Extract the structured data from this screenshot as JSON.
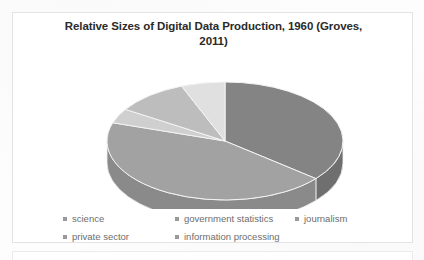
{
  "document": {
    "background_color": "#fdfdfd",
    "frame_border_color": "#e3e3e3"
  },
  "chart": {
    "title_line_1": "Relative Sizes of Digital Data Production, 1960 (Groves,",
    "title_line_2": "2011)",
    "title_full": "Relative Sizes of Digital Data Production, 1960 (Groves, 2011)",
    "title_color": "#2b2b2b"
  },
  "legend": {
    "rows": [
      [
        {
          "label": "science",
          "color": "#9a9a9a"
        },
        {
          "label": "government statistics",
          "color": "#9a9a9a"
        },
        {
          "label": "journalism",
          "color": "#9a9a9a"
        }
      ],
      [
        {
          "label": "private sector",
          "color": "#9a9a9a"
        },
        {
          "label": "information processing",
          "color": "#9a9a9a"
        }
      ]
    ],
    "text_color": "#6d6d6d"
  },
  "chart_data": {
    "type": "pie",
    "title": "Relative Sizes of Digital Data Production, 1960 (Groves, 2011)",
    "three_d": true,
    "legend_position": "bottom",
    "grid": false,
    "categories": [
      "science",
      "government statistics",
      "journalism",
      "private sector",
      "information processing"
    ],
    "values": [
      36,
      44,
      4,
      10,
      6
    ],
    "unit": "percent",
    "colors": [
      "#848484",
      "#a2a2a2",
      "#cfcfcf",
      "#bdbdbd",
      "#e0e0e0"
    ],
    "side_colors": [
      "#6f6f6f",
      "#8a8a8a",
      "#b0b0b0",
      "#a0a0a0",
      "#c2c2c2"
    ],
    "geometry": {
      "center_x": 199,
      "center_y": 84,
      "radius_x": 118,
      "radius_y": 59,
      "depth": 22,
      "start_angle_deg": -90
    }
  }
}
